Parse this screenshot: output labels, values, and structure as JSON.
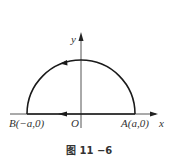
{
  "figure": {
    "caption": "图 11 −6",
    "axes": {
      "x_label": "x",
      "y_label": "y",
      "origin_label": "O"
    },
    "points": {
      "A": {
        "label": "A(a,0)"
      },
      "B": {
        "label": "B(−a,0)"
      }
    },
    "curve": {
      "type": "upper-semicircle",
      "center": "O",
      "radius": "a",
      "orientation": "counterclockwise from A to B along arc, then B to A along x-axis",
      "arc_arrow_direction": "left",
      "segment_arrow_direction": "left"
    },
    "colors": {
      "stroke": "#1a1a1a",
      "text": "#333333",
      "background": "#ffffff"
    }
  }
}
